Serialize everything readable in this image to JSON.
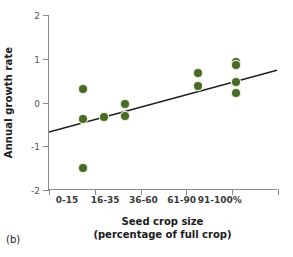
{
  "panel_label": "(b)",
  "chart_data": {
    "type": "scatter",
    "title": "",
    "xlabel": "Seed crop size",
    "xlabel_line2": "(percentage of full crop)",
    "ylabel": "Annual growth rate",
    "xlim": [
      0,
      6
    ],
    "ylim": [
      -2,
      2
    ],
    "grid": false,
    "legend": "none",
    "x_tick_labels": [
      "0-15",
      "16-35",
      "36-60",
      "61-90",
      "91-100%"
    ],
    "x_tick_positions": [
      1,
      2,
      3,
      4,
      5
    ],
    "x_tick_count": 6,
    "y_tick_labels": [
      "2",
      "1",
      "0",
      "-1",
      "-2"
    ],
    "y_tick_values": [
      2,
      1,
      0,
      -1,
      -2
    ],
    "marker_color": "#4a6b28",
    "marker_edge_color": "#e8edd8",
    "line_color": "#1b1b1d",
    "axis_color": "#8a8a8a",
    "points": [
      {
        "x": 0.9,
        "y": 0.32
      },
      {
        "x": 0.9,
        "y": -0.38
      },
      {
        "x": 0.9,
        "y": -1.49
      },
      {
        "x": 1.45,
        "y": -0.34
      },
      {
        "x": 2.0,
        "y": -0.04
      },
      {
        "x": 2.0,
        "y": -0.31
      },
      {
        "x": 3.9,
        "y": 0.67
      },
      {
        "x": 3.9,
        "y": 0.38
      },
      {
        "x": 4.9,
        "y": 0.92
      },
      {
        "x": 4.9,
        "y": 0.85
      },
      {
        "x": 4.9,
        "y": 0.47
      },
      {
        "x": 4.9,
        "y": 0.22
      }
    ],
    "trend_line": {
      "x_start": 0.0,
      "y_start": -0.69,
      "x_end": 6.0,
      "y_end": 0.73
    }
  }
}
